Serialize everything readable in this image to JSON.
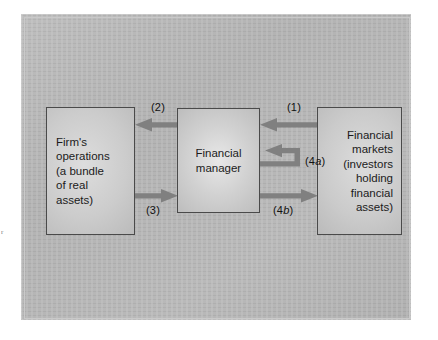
{
  "figure": {
    "title_fragment": "r",
    "background_color": "#b6b6b6",
    "frame_color": "#c9c9c9",
    "arrow_color": "#808080",
    "box_border_color": "#4a4a4a",
    "text_color": "#1b1b1b"
  },
  "nodes": [
    {
      "id": "firm-operations",
      "lines": [
        "Firm's",
        "operations",
        "(a bundle",
        "of real",
        "assets)"
      ],
      "align": "left"
    },
    {
      "id": "financial-manager",
      "lines": [
        "Financial",
        "manager"
      ],
      "align": "center"
    },
    {
      "id": "financial-markets",
      "lines": [
        "Financial",
        "markets",
        "(investors",
        "holding",
        "financial",
        "assets)"
      ],
      "align": "right"
    }
  ],
  "flows": [
    {
      "id": "flow-1",
      "label": "(1)",
      "from": "financial-markets",
      "to": "financial-manager",
      "direction": "left"
    },
    {
      "id": "flow-2",
      "label": "(2)",
      "from": "financial-manager",
      "to": "firm-operations",
      "direction": "left"
    },
    {
      "id": "flow-3",
      "label": "(3)",
      "from": "firm-operations",
      "to": "financial-manager",
      "direction": "right"
    },
    {
      "id": "flow-4a",
      "label_prefix": "(4",
      "label_italic": "a",
      "label_suffix": ")",
      "from": "financial-manager",
      "to": "financial-manager",
      "direction": "hook-left"
    },
    {
      "id": "flow-4b",
      "label_prefix": "(4",
      "label_italic": "b",
      "label_suffix": ")",
      "from": "financial-manager",
      "to": "financial-markets",
      "direction": "right"
    }
  ]
}
